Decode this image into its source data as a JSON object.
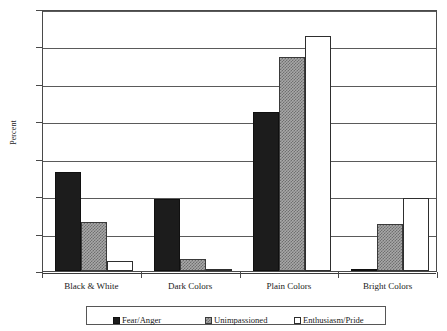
{
  "chart_data": {
    "type": "bar",
    "title": "",
    "xlabel": "",
    "ylabel": "Percent",
    "ylim": [
      0,
      35
    ],
    "yticks": [
      0,
      5,
      10,
      15,
      20,
      25,
      30,
      35
    ],
    "grid": true,
    "legend_position": "bottom",
    "categories": [
      "Black & White",
      "Dark Colors",
      "Plain Colors",
      "Bright Colors"
    ],
    "series": [
      {
        "name": "Fear/Anger",
        "color": "#1c1c1c",
        "fill": "solid-black",
        "values": [
          13.2,
          9.6,
          21.2,
          0.2
        ]
      },
      {
        "name": "Unimpassioned",
        "color": "#a8a8a8",
        "fill": "checker-grey",
        "values": [
          6.6,
          1.6,
          28.6,
          6.3
        ]
      },
      {
        "name": "Enthusiasm/Pride",
        "color": "#ffffff",
        "fill": "white-outline",
        "values": [
          1.4,
          0.3,
          31.4,
          9.8
        ]
      }
    ]
  },
  "axis": {
    "y_title": "Percent",
    "tick_labels": [
      "35",
      "30",
      "25",
      "20",
      "15",
      "10",
      "5",
      "0"
    ]
  },
  "legend": {
    "items": [
      {
        "label": "Fear/Anger"
      },
      {
        "label": "Unimpassioned"
      },
      {
        "label": "Enthusiasm/Pride"
      }
    ]
  }
}
